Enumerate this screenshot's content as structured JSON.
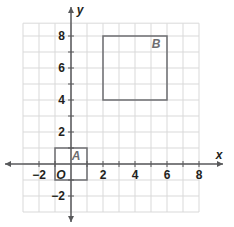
{
  "diagram": {
    "type": "coordinate-grid",
    "axes": {
      "x_label": "x",
      "y_label": "y",
      "origin_label": "O",
      "x_range": [
        -3,
        8
      ],
      "y_range": [
        -3,
        9
      ],
      "x_ticks": [
        {
          "value": -2,
          "label": "−2"
        },
        {
          "value": 2,
          "label": "2"
        },
        {
          "value": 4,
          "label": "4"
        },
        {
          "value": 6,
          "label": "6"
        },
        {
          "value": 8,
          "label": "8"
        }
      ],
      "y_ticks": [
        {
          "value": -2,
          "label": "−2"
        },
        {
          "value": 2,
          "label": "2"
        },
        {
          "value": 4,
          "label": "4"
        },
        {
          "value": 6,
          "label": "6"
        },
        {
          "value": 8,
          "label": "8"
        }
      ]
    },
    "shapes": [
      {
        "name": "A",
        "label": "A",
        "type": "square",
        "x1": -1,
        "y1": -1,
        "x2": 1,
        "y2": 1
      },
      {
        "name": "B",
        "label": "B",
        "type": "square",
        "x1": 2,
        "y1": 4,
        "x2": 6,
        "y2": 8
      }
    ],
    "colors": {
      "grid": "#d9d9d9",
      "axis": "#58595b",
      "shape_stroke": "#6d6e71",
      "text": "#231f20"
    }
  }
}
